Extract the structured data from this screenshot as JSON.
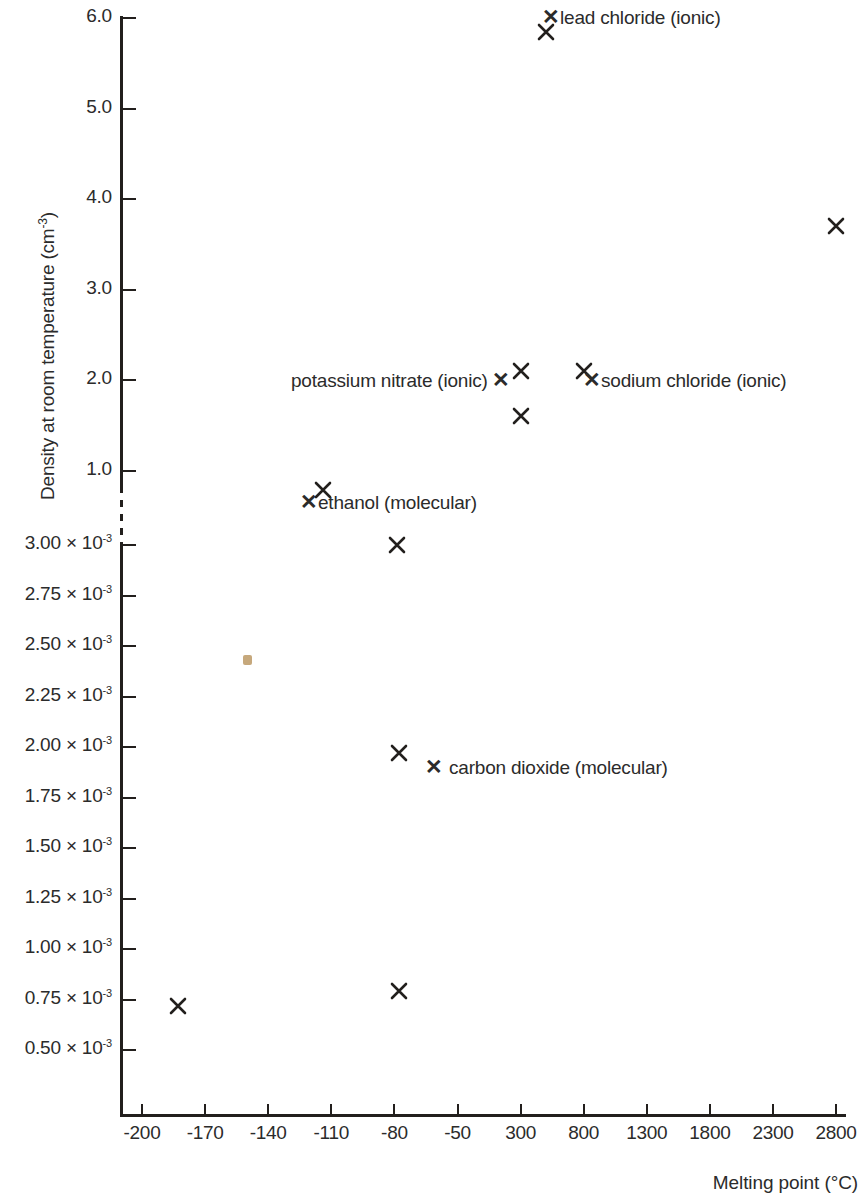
{
  "chart_data": {
    "type": "scatter",
    "title": "",
    "xlabel": "Melting point (°C)",
    "ylabel_text": "Density at room temperature (cm",
    "ylabel_sup": "-3",
    "ylabel_tail": ")",
    "xticks": [
      "-200",
      "-170",
      "-140",
      "-110",
      "-80",
      "-50",
      "300",
      "800",
      "1300",
      "1800",
      "2300",
      "2800"
    ],
    "xtick_values": [
      -200,
      -170,
      -140,
      -110,
      -80,
      -50,
      300,
      800,
      1300,
      1800,
      2300,
      2800
    ],
    "yticks_upper": [
      "6.0",
      "5.0",
      "4.0",
      "3.0",
      "2.0",
      "1.0"
    ],
    "yticks_lower_mantissa": [
      "3.00",
      "2.75",
      "2.50",
      "2.25",
      "2.00",
      "1.75",
      "1.50",
      "1.25",
      "1.00",
      "0.75",
      "0.50"
    ],
    "yticks_lower_multiplier": " × 10",
    "yticks_lower_exponent": "-3",
    "y_axis_broken": true,
    "grid": false,
    "legend": "none",
    "points": [
      {
        "label": "lead chloride (ionic)",
        "x": 500,
        "y": 5.85,
        "marker": "x",
        "annotated": true
      },
      {
        "label": "",
        "x": 2800,
        "y": 3.7,
        "marker": "x",
        "annotated": false
      },
      {
        "label": "potassium nitrate (ionic)",
        "x": 300,
        "y": 2.1,
        "marker": "x",
        "annotated": true
      },
      {
        "label": "sodium chloride (ionic)",
        "x": 800,
        "y": 2.1,
        "marker": "x",
        "annotated": true
      },
      {
        "label": "",
        "x": 300,
        "y": 1.6,
        "marker": "x",
        "annotated": false
      },
      {
        "label": "ethanol (molecular)",
        "x": -114,
        "y": 0.79,
        "marker": "x",
        "annotated": true
      },
      {
        "label": "",
        "x": -79,
        "y": 0.003,
        "marker": "x",
        "annotated": false
      },
      {
        "label": "",
        "x": -150,
        "y": 0.00243,
        "marker": "dot",
        "annotated": false,
        "color": "#c6a87c"
      },
      {
        "label": "carbon dioxide (molecular)",
        "x": -78,
        "y": 0.00197,
        "marker": "x",
        "annotated": true
      },
      {
        "label": "",
        "x": -78,
        "y": 0.00079,
        "marker": "x",
        "annotated": false
      },
      {
        "label": "",
        "x": -183,
        "y": 0.00072,
        "marker": "x",
        "annotated": false
      }
    ],
    "annotations": [
      {
        "name": "lead-chloride",
        "text": "lead chloride (ionic)",
        "glyph_side": "left"
      },
      {
        "name": "potassium-nitrate",
        "text": "potassium nitrate (ionic)",
        "glyph_side": "right"
      },
      {
        "name": "sodium-chloride",
        "text": "sodium chloride (ionic)",
        "glyph_side": "left"
      },
      {
        "name": "ethanol",
        "text": "ethanol (molecular)",
        "glyph_side": "left"
      },
      {
        "name": "carbon-dioxide",
        "text": "carbon dioxide (molecular)",
        "glyph_side": "left"
      }
    ],
    "marker_glyph": "✕",
    "colors": {
      "axis": "#221f1d",
      "text": "#2b2b2b",
      "marker": "#221f1d",
      "dot_marker": "#c6a87c",
      "background": "#ffffff"
    }
  }
}
